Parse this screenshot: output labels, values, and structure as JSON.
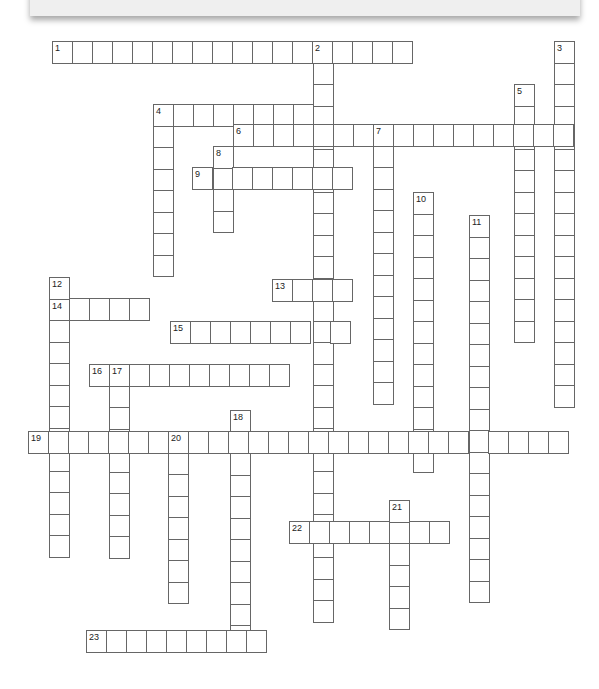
{
  "puzzle": {
    "header_text": "",
    "cell_w": 20,
    "cell_h": 21.5,
    "words": [
      {
        "num": "1",
        "dir": "across",
        "x": 52,
        "y": 41,
        "len": 18
      },
      {
        "num": "2",
        "dir": "down",
        "x": 313,
        "y": 41,
        "len": 27
      },
      {
        "num": "3",
        "dir": "down",
        "x": 554,
        "y": 41,
        "len": 17
      },
      {
        "num": "4",
        "dir": "across",
        "x": 153,
        "y": 104,
        "len": 9
      },
      {
        "num": "4",
        "dir": "down",
        "x": 153,
        "y": 104,
        "len": 8
      },
      {
        "num": "5",
        "dir": "down",
        "x": 514,
        "y": 84,
        "len": 12
      },
      {
        "num": "6",
        "dir": "across",
        "x": 233,
        "y": 124,
        "len": 17
      },
      {
        "num": "7",
        "dir": "down",
        "x": 373,
        "y": 124,
        "len": 13
      },
      {
        "num": "8",
        "dir": "down",
        "x": 213,
        "y": 146,
        "len": 4
      },
      {
        "num": "9",
        "dir": "across",
        "x": 192,
        "y": 167,
        "len": 8
      },
      {
        "num": "10",
        "dir": "down",
        "x": 413,
        "y": 192,
        "len": 13
      },
      {
        "num": "11",
        "dir": "down",
        "x": 469,
        "y": 215,
        "len": 18
      },
      {
        "num": "12",
        "dir": "down",
        "x": 49,
        "y": 277,
        "len": 13
      },
      {
        "num": "13",
        "dir": "across",
        "x": 272,
        "y": 279,
        "len": 4
      },
      {
        "num": "14",
        "dir": "across",
        "x": 49,
        "y": 298,
        "len": 5
      },
      {
        "num": "15",
        "dir": "across",
        "x": 170,
        "y": 321,
        "len": 9
      },
      {
        "num": "16",
        "dir": "across",
        "x": 89,
        "y": 364,
        "len": 10
      },
      {
        "num": "17",
        "dir": "down",
        "x": 109,
        "y": 364,
        "len": 9
      },
      {
        "num": "18",
        "dir": "down",
        "x": 230,
        "y": 410,
        "len": 11
      },
      {
        "num": "19",
        "dir": "across",
        "x": 28,
        "y": 431,
        "len": 27
      },
      {
        "num": "20",
        "dir": "down",
        "x": 168,
        "y": 431,
        "len": 8
      },
      {
        "num": "21",
        "dir": "down",
        "x": 389,
        "y": 500,
        "len": 6
      },
      {
        "num": "22",
        "dir": "across",
        "x": 289,
        "y": 521,
        "len": 8
      },
      {
        "num": "23",
        "dir": "across",
        "x": 86,
        "y": 630,
        "len": 9
      }
    ]
  }
}
